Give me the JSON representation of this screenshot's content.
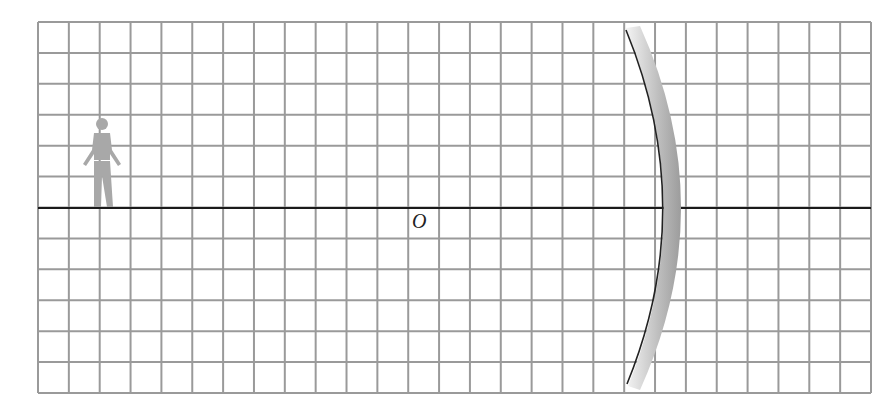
{
  "diagram": {
    "type": "concave-mirror-ray-grid",
    "grid": {
      "columns": 27,
      "rows": 12,
      "line_color": "#9a9a9a"
    },
    "principal_axis": {
      "color": "#1a1a1a"
    },
    "origin_label": "O",
    "object": {
      "kind": "person-figure",
      "color": "#a8a8a8",
      "position_cell_from_left": 2
    },
    "mirror": {
      "kind": "concave-mirror",
      "reflecting_side": "left"
    }
  }
}
